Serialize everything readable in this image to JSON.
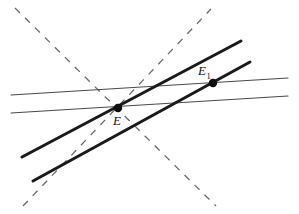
{
  "figure": {
    "width": 299,
    "height": 214,
    "background": "#ffffff"
  },
  "style": {
    "thin_color": "#4a4a4a",
    "thin_width": 1.1,
    "thick_color": "#1a1a1a",
    "thick_width": 3.0,
    "dashed_color": "#6b6b6b",
    "dashed_width": 1.3,
    "dash_pattern": "7 7",
    "point_color": "#0d0d0d",
    "point_radius": 4.2,
    "label_color": "#111111"
  },
  "lines": {
    "thin": [
      {
        "name": "thin-line-upper",
        "x1": 11,
        "y1": 95,
        "x2": 288,
        "y2": 78
      },
      {
        "name": "thin-line-lower",
        "x1": 11,
        "y1": 113,
        "x2": 288,
        "y2": 96
      }
    ],
    "thick": [
      {
        "name": "thick-line-upper",
        "x1": 22,
        "y1": 157,
        "x2": 241,
        "y2": 41
      },
      {
        "name": "thick-line-lower",
        "x1": 33,
        "y1": 181,
        "x2": 250,
        "y2": 62
      }
    ],
    "dashed": [
      {
        "name": "dashed-line-descending",
        "x1": 15,
        "y1": 8,
        "x2": 216,
        "y2": 206
      },
      {
        "name": "dashed-line-ascending",
        "x1": 23,
        "y1": 206,
        "x2": 211,
        "y2": 9
      }
    ]
  },
  "points": [
    {
      "name": "point-E",
      "label": "E",
      "subscript": "",
      "x": 118,
      "y": 108,
      "label_x": 113,
      "label_y": 125
    },
    {
      "name": "point-E1",
      "label": "E",
      "subscript": "1",
      "x": 213,
      "y": 83,
      "label_x": 198,
      "label_y": 75
    }
  ]
}
